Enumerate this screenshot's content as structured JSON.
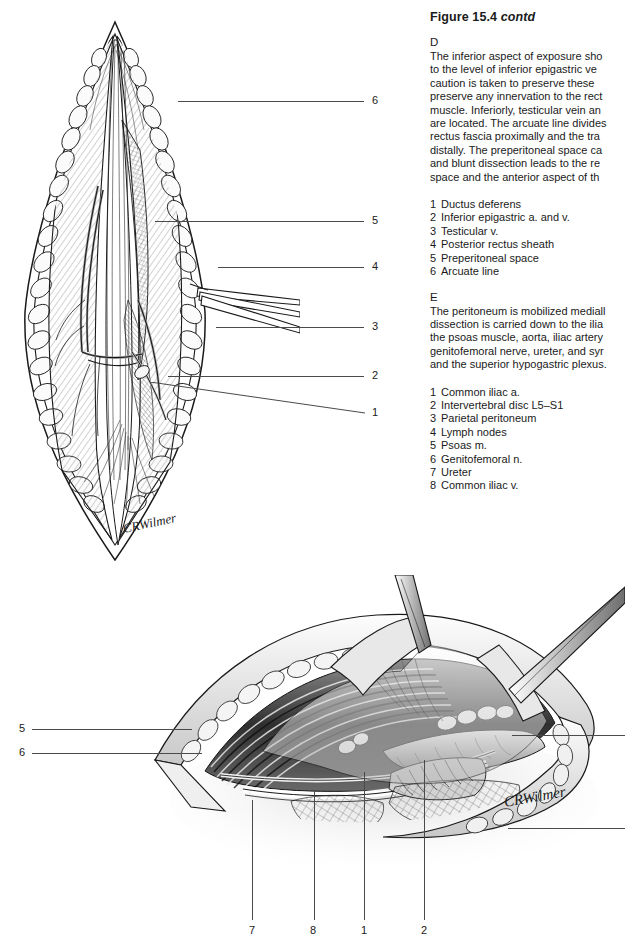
{
  "figure": {
    "title_main": "Figure 15.4",
    "title_cont": "contd"
  },
  "panels": [
    {
      "letter": "D",
      "paragraph_lines": [
        "The inferior aspect of exposure sho",
        "to the level of inferior epigastric ve",
        "caution is taken to preserve these ",
        "preserve any innervation to the rect",
        "muscle. Inferiorly, testicular vein an",
        "are located. The arcuate line divides",
        "rectus fascia proximally and the tra",
        "distally. The preperitoneal space ca",
        "and blunt dissection leads to the re",
        "space and the anterior aspect of th"
      ],
      "key": [
        {
          "num": "1",
          "label": "Ductus deferens"
        },
        {
          "num": "2",
          "label": "Inferior epigastric a. and v."
        },
        {
          "num": "3",
          "label": "Testicular v."
        },
        {
          "num": "4",
          "label": "Posterior rectus sheath"
        },
        {
          "num": "5",
          "label": "Preperitoneal space"
        },
        {
          "num": "6",
          "label": "Arcuate line"
        }
      ]
    },
    {
      "letter": "E",
      "paragraph_lines": [
        "The peritoneum is mobilized mediall",
        "dissection is carried down to the ilia",
        "the psoas muscle, aorta, iliac artery",
        "genitofemoral nerve, ureter, and syr",
        "and the superior hypogastric plexus."
      ],
      "key": [
        {
          "num": "1",
          "label": "Common iliac a."
        },
        {
          "num": "2",
          "label": "Intervertebral disc L5–S1"
        },
        {
          "num": "3",
          "label": "Parietal peritoneum"
        },
        {
          "num": "4",
          "label": "Lymph nodes"
        },
        {
          "num": "5",
          "label": "Psoas m."
        },
        {
          "num": "6",
          "label": "Genitofemoral n."
        },
        {
          "num": "7",
          "label": "Ureter"
        },
        {
          "num": "8",
          "label": "Common iliac v."
        }
      ]
    }
  ],
  "figure_d": {
    "caption_letter": "D",
    "signature": "CRWilmer",
    "callouts": [
      {
        "num": "6",
        "x": 372,
        "y": 94
      },
      {
        "num": "5",
        "x": 372,
        "y": 214
      },
      {
        "num": "4",
        "x": 372,
        "y": 260
      },
      {
        "num": "3",
        "x": 372,
        "y": 320
      },
      {
        "num": "2",
        "x": 372,
        "y": 369
      },
      {
        "num": "1",
        "x": 372,
        "y": 406
      }
    ]
  },
  "figure_e": {
    "caption_letter": "E",
    "signature": "CRWilmer",
    "callouts_left": [
      {
        "num": "5",
        "x": 19,
        "y": 723
      },
      {
        "num": "6",
        "x": 19,
        "y": 747
      }
    ],
    "callouts_bottom": [
      {
        "num": "7",
        "x": 249,
        "y": 925
      },
      {
        "num": "8",
        "x": 310,
        "y": 925
      },
      {
        "num": "1",
        "x": 361,
        "y": 925
      },
      {
        "num": "2",
        "x": 421,
        "y": 925
      }
    ]
  },
  "colors": {
    "ink": "#1a1a1a",
    "leader": "#4a4a4a",
    "fat_light": "#f2f2f2",
    "muscle_dark": "#3a3a3a",
    "tissue_mid": "#9a9a9a"
  }
}
